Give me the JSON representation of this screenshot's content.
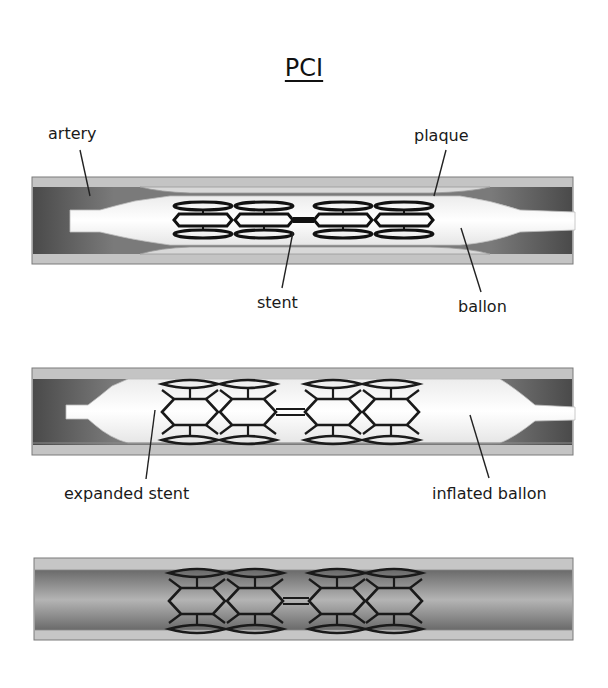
{
  "title": "PCI",
  "panels": [
    {
      "id": "panel-1",
      "state": "deflated balloon with stent inside narrowed artery",
      "labels": {
        "artery": "artery",
        "plaque": "plaque",
        "stent": "stent",
        "balloon": "ballon"
      }
    },
    {
      "id": "panel-2",
      "state": "inflated balloon expanding stent",
      "labels": {
        "expanded_stent": "expanded stent",
        "inflated_balloon": "inflated ballon"
      }
    },
    {
      "id": "panel-3",
      "state": "stent left in place, balloon removed",
      "labels": {}
    }
  ],
  "colors": {
    "background": "#ffffff",
    "artery_wall": "#c8c8c8",
    "artery_lumen_dark": "#6e6e6e",
    "plaque": "#d6d6d6",
    "balloon": "#fafafa",
    "stent_strut": "#1a1a1a",
    "text": "#1a1a1a"
  }
}
